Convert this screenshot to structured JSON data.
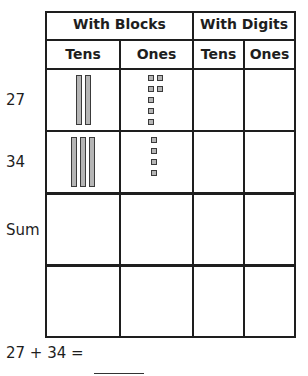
{
  "table": {
    "group_headers": [
      "With Blocks",
      "With Digits"
    ],
    "column_headers": [
      "Tens",
      "Ones",
      "Tens",
      "Ones"
    ],
    "rows": [
      {
        "label": "27",
        "blocks": {
          "tens_rods": 2,
          "ones_cubes": 7
        },
        "digits": {
          "tens": "",
          "ones": ""
        }
      },
      {
        "label": "34",
        "blocks": {
          "tens_rods": 3,
          "ones_cubes": 4
        },
        "digits": {
          "tens": "",
          "ones": ""
        }
      },
      {
        "label": "Sum",
        "blocks": {
          "tens_rods": 0,
          "ones_cubes": 0
        },
        "digits": {
          "tens": "",
          "ones": ""
        }
      },
      {
        "label": "",
        "blocks": {
          "tens_rods": 0,
          "ones_cubes": 0
        },
        "digits": {
          "tens": "",
          "ones": ""
        }
      }
    ]
  },
  "equation": {
    "text": "27 + 34 =",
    "answer": ""
  }
}
